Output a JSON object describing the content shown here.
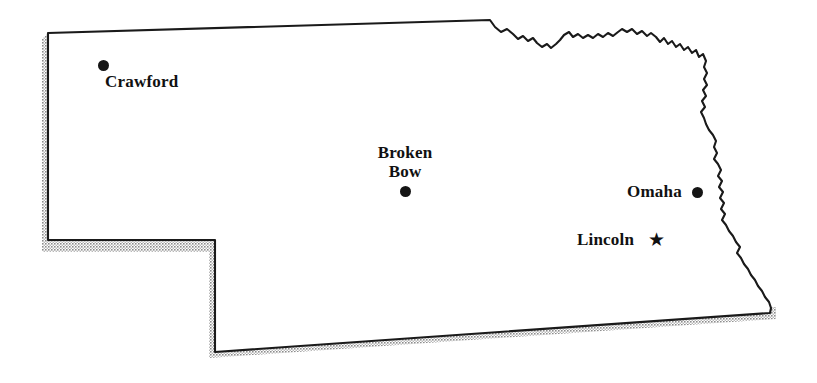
{
  "map": {
    "title": "Nebraska",
    "region_name": "Nebraska",
    "style": {
      "outline_color": "#1a1a1a",
      "fill_color": "#ffffff",
      "shadow_color": "#9a9a9a",
      "background_color": "#ffffff",
      "outline_width": 2
    },
    "cities": [
      {
        "name": "Crawford",
        "label_lines": [
          "Crawford"
        ],
        "marker": "dot",
        "marker_x": 103,
        "marker_y": 65,
        "marker_size": 11,
        "label_x": 105,
        "label_y": 72,
        "label_align": "left"
      },
      {
        "name": "Broken Bow",
        "label_lines": [
          "Broken",
          "Bow"
        ],
        "marker": "dot",
        "marker_x": 405,
        "marker_y": 191,
        "marker_size": 11,
        "label_x": 405,
        "label_y": 143,
        "label_align": "center"
      },
      {
        "name": "Omaha",
        "label_lines": [
          "Omaha"
        ],
        "marker": "dot",
        "marker_x": 697,
        "marker_y": 192,
        "marker_size": 11,
        "label_x": 627,
        "label_y": 182,
        "label_align": "left"
      },
      {
        "name": "Lincoln",
        "label_lines": [
          "Lincoln"
        ],
        "marker": "star",
        "marker_x": 655,
        "marker_y": 240,
        "marker_size": 19,
        "marker_glyph": "★",
        "label_x": 577,
        "label_y": 230,
        "label_align": "left"
      }
    ],
    "geometry": {
      "state_outline_path": "M48,33 L490,20 L495,26 L500,31 L506,29 L512,33 L517,37 L521,35 L526,40 L531,37 L535,41 L540,45 L545,42 L549,46 L554,43 L559,40 L563,35 L568,32 L572,36 L577,34 L582,37 L587,35 L592,37 L597,34 L602,36 L607,33 L612,35 L617,32 L621,29 L626,31 L631,29 L636,33 L641,31 L646,35 L650,33 L655,36 L659,41 L663,38 L667,43 L671,41 L675,46 L679,44 L683,49 L687,47 L691,52 L695,50 L698,56 L702,54 L705,60 L703,66 L706,72 L703,78 L706,84 L702,89 L705,95 L701,100 L704,106 L700,111 L703,117 L705,123 L708,129 L712,134 L715,140 L713,146 L716,152 L713,158 L717,163 L720,169 L717,175 L721,180 L718,186 L722,191 L719,197 L723,202 L720,208 L724,213 L721,219 L725,224 L728,230 L732,235 L735,241 L739,246 L736,252 L740,257 L743,263 L747,268 L750,274 L754,279 L757,285 L761,290 L764,296 L768,301 L771,307 L770,313 L215,352 L215,240 L48,240 Z",
      "shadow_offset_x": 5,
      "shadow_offset_y": 6
    }
  }
}
